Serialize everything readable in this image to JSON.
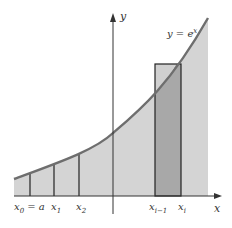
{
  "diagram": {
    "function_label": "y = e",
    "function_exponent": "x",
    "axis_labels": {
      "x": "x",
      "y": "y"
    },
    "partition_labels": [
      {
        "base": "x",
        "sub": "0",
        "suffix": " = a"
      },
      {
        "base": "x",
        "sub": "1",
        "suffix": ""
      },
      {
        "base": "x",
        "sub": "2",
        "suffix": ""
      },
      {
        "base": "x",
        "sub": "i−1",
        "suffix": ""
      },
      {
        "base": "x",
        "sub": "i",
        "suffix": ""
      }
    ],
    "colors": {
      "area_fill": "#d4d4d4",
      "rectangle_fill": "#a8a8a8",
      "curve": "#6e6e6e",
      "axis": "#333333",
      "lines": "#222222"
    }
  }
}
